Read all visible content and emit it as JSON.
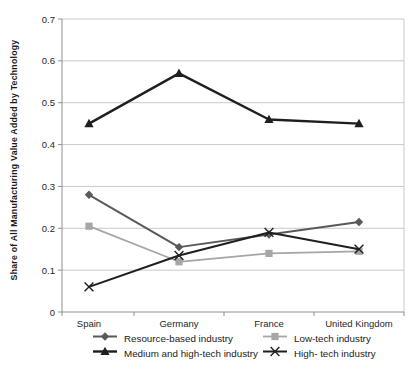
{
  "colors": {
    "gridline": "#c9c9c9",
    "axis": "#8f8f8f",
    "tick_text": "#262626",
    "background": "#ffffff"
  },
  "chart_data": {
    "type": "line",
    "categories": [
      "Spain",
      "Germany",
      "France",
      "United Kingdom"
    ],
    "series": [
      {
        "name": "Resource-based industry",
        "marker": "diamond",
        "color": "#595959",
        "values": [
          0.28,
          0.155,
          0.185,
          0.215
        ]
      },
      {
        "name": "Low-tech industry",
        "marker": "square",
        "color": "#a6a6a6",
        "values": [
          0.205,
          0.12,
          0.14,
          0.145
        ]
      },
      {
        "name": "Medium and high-tech industry",
        "marker": "triangle",
        "color": "#1f1f1f",
        "values": [
          0.45,
          0.57,
          0.46,
          0.45
        ]
      },
      {
        "name": "High- tech industry",
        "marker": "x",
        "color": "#1f1f1f",
        "values": [
          0.06,
          0.135,
          0.19,
          0.15
        ]
      }
    ],
    "title": "",
    "xlabel": "",
    "ylabel": "Share of All Manufacturing Value Added by Technology",
    "ylim": [
      0,
      0.7
    ],
    "ytick_step": 0.1,
    "yticks": [
      "0",
      "0.1",
      "0.2",
      "0.3",
      "0.4",
      "0.5",
      "0.6",
      "0.7"
    ],
    "grid": true,
    "legend_position": "bottom"
  }
}
